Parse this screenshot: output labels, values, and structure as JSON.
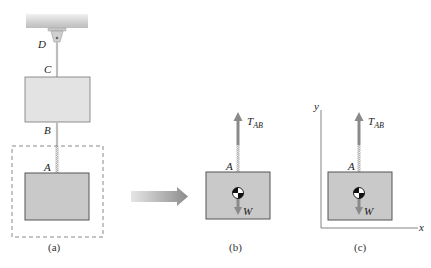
{
  "figure": {
    "panels": [
      {
        "id": "a",
        "caption": "(a)"
      },
      {
        "id": "b",
        "caption": "(b)"
      },
      {
        "id": "c",
        "caption": "(c)"
      }
    ],
    "points": {
      "D": "D",
      "C": "C",
      "B": "B",
      "A": "A"
    },
    "forces": {
      "tension_main": "T",
      "tension_sub": "AB",
      "weight": "W"
    },
    "axes": {
      "x": "x",
      "y": "y"
    },
    "colors": {
      "block_upper": "#e3e3e3",
      "block_lower": "#c9c9c9",
      "block_border": "#555555",
      "force_arrow": "#8a8a8a",
      "ceiling": "#d8d8d8",
      "dashed_boundary": "#888888"
    }
  }
}
